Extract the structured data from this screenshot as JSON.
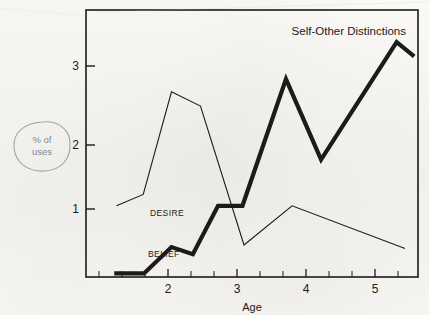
{
  "chart_data": {
    "type": "line",
    "title": "Self-Other Distinctions",
    "xlabel": "Age",
    "ylabel": "",
    "xlim": [
      1.6,
      5.95
    ],
    "ylim": [
      0,
      3.75
    ],
    "grid": false,
    "legend": "inline-labels",
    "xticks": [
      2,
      3,
      4,
      5
    ],
    "xtick_labels": [
      "2",
      "3",
      "4",
      "5"
    ],
    "yticks": [
      1,
      2,
      3
    ],
    "ytick_labels": [
      "1",
      "2",
      "3"
    ],
    "series": [
      {
        "name": "BELIEF",
        "style": "thick",
        "x": [
          1.97,
          2.36,
          2.72,
          3.0,
          3.33,
          3.65,
          4.22,
          4.68,
          5.67,
          5.9
        ],
        "values": [
          0.05,
          0.05,
          0.42,
          0.32,
          1.0,
          1.0,
          2.78,
          1.65,
          3.3,
          3.1
        ]
      },
      {
        "name": "DESIRE",
        "style": "thin",
        "x": [
          2.0,
          2.35,
          2.72,
          3.1,
          3.67,
          4.3,
          5.78
        ],
        "values": [
          1.0,
          1.16,
          2.6,
          2.4,
          0.45,
          1.0,
          0.4
        ]
      }
    ],
    "annotations": [
      {
        "name": "percent-of-uses",
        "line1": "% of",
        "line2": "uses",
        "color": "#9aa6ae"
      },
      {
        "name": "series-label-desire",
        "text": "DESIRE"
      },
      {
        "name": "series-label-belief",
        "text": "BELIEF"
      }
    ]
  },
  "colors": {
    "ink": "#1b1b1b",
    "paper": "#f7f6f2",
    "annotation": "#9aa6ae"
  }
}
